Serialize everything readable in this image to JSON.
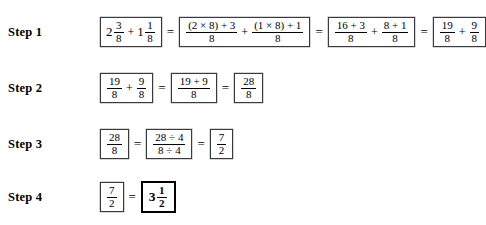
{
  "document": {
    "title": "Adding Mixed Numbers - Worked Steps",
    "background_color": "#ffffff",
    "text_color": "#000000",
    "box_border_color": "#3a3a3a",
    "final_box_border_color": "#000000"
  },
  "symbols": {
    "equals": "=",
    "plus": "+",
    "times": "×",
    "divide": "÷"
  },
  "steps": [
    {
      "label": "Step 1",
      "boxes": [
        {
          "kind": "mixed-sum",
          "terms": [
            {
              "whole": "2",
              "num": "3",
              "den": "8"
            },
            {
              "whole": "1",
              "num": "1",
              "den": "8"
            }
          ]
        },
        {
          "kind": "fraction-sum",
          "terms": [
            {
              "num": "(2 × 8) + 3",
              "den": "8"
            },
            {
              "num": "(1 × 8) + 1",
              "den": "8"
            }
          ]
        },
        {
          "kind": "fraction-sum",
          "terms": [
            {
              "num": "16 + 3",
              "den": "8"
            },
            {
              "num": "8 + 1",
              "den": "8"
            }
          ]
        },
        {
          "kind": "fraction-sum",
          "terms": [
            {
              "num": "19",
              "den": "8"
            },
            {
              "num": "9",
              "den": "8"
            }
          ]
        }
      ]
    },
    {
      "label": "Step 2",
      "boxes": [
        {
          "kind": "fraction-sum",
          "terms": [
            {
              "num": "19",
              "den": "8"
            },
            {
              "num": "9",
              "den": "8"
            }
          ]
        },
        {
          "kind": "fraction",
          "terms": [
            {
              "num": "19 + 9",
              "den": "8"
            }
          ]
        },
        {
          "kind": "fraction",
          "terms": [
            {
              "num": "28",
              "den": "8"
            }
          ]
        }
      ]
    },
    {
      "label": "Step 3",
      "boxes": [
        {
          "kind": "fraction",
          "terms": [
            {
              "num": "28",
              "den": "8"
            }
          ]
        },
        {
          "kind": "fraction",
          "terms": [
            {
              "num": "28 ÷ 4",
              "den": "8 ÷ 4"
            }
          ]
        },
        {
          "kind": "fraction",
          "terms": [
            {
              "num": "7",
              "den": "2"
            }
          ]
        }
      ]
    },
    {
      "label": "Step 4",
      "boxes": [
        {
          "kind": "fraction",
          "terms": [
            {
              "num": "7",
              "den": "2"
            }
          ]
        },
        {
          "kind": "mixed",
          "final": true,
          "terms": [
            {
              "whole": "3",
              "num": "1",
              "den": "2"
            }
          ]
        }
      ]
    }
  ]
}
